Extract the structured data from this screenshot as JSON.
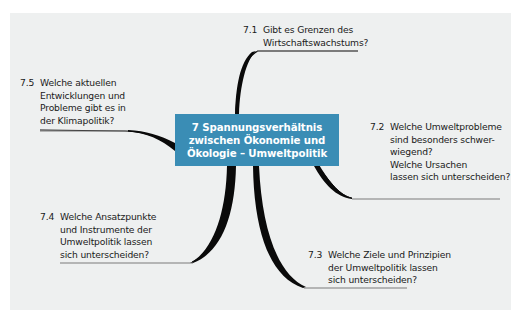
{
  "diagram": {
    "type": "mind-map",
    "colors": {
      "panel_background": "#eef0f0",
      "center_box": "#3a8db5",
      "center_text": "#ffffff",
      "branch": "#0a0a0a",
      "underline": "#7a7a7a",
      "text": "#1a1a1a"
    },
    "center": {
      "number": "7",
      "lines": [
        "7  Spannungsverhältnis",
        "zwischen Ökonomie und",
        "Ökologie – Umweltpolitik"
      ]
    },
    "nodes": [
      {
        "id": "7.1",
        "number": "7.1",
        "lines": [
          "Gibt es Grenzen des",
          "Wirtschaftswachstums?"
        ]
      },
      {
        "id": "7.2",
        "number": "7.2",
        "lines": [
          "Welche Umweltprobleme",
          "sind besonders schwer-",
          "wiegend?",
          "Welche Ursachen",
          "lassen sich unterscheiden?"
        ]
      },
      {
        "id": "7.3",
        "number": "7.3",
        "lines": [
          "Welche Ziele und Prinzipien",
          "der Umweltpolitik lassen",
          "sich unterscheiden?"
        ]
      },
      {
        "id": "7.4",
        "number": "7.4",
        "lines": [
          "Welche Ansatzpunkte",
          "und Instrumente der",
          "Umweltpolitik lassen",
          "sich unterscheiden?"
        ]
      },
      {
        "id": "7.5",
        "number": "7.5",
        "lines": [
          "Welche aktuellen",
          "Entwicklungen und",
          "Probleme gibt es in",
          "der Klimapolitik?"
        ]
      }
    ]
  }
}
